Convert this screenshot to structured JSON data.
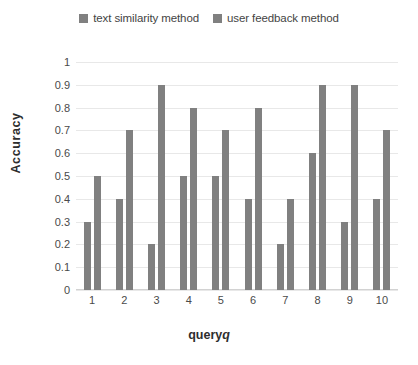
{
  "chart_data": {
    "type": "bar",
    "title": "",
    "xlabel": "query q",
    "xlabel_text": "query",
    "xlabel_variable": "q",
    "ylabel": "Accuracy",
    "categories": [
      "1",
      "2",
      "3",
      "4",
      "5",
      "6",
      "7",
      "8",
      "9",
      "10"
    ],
    "series": [
      {
        "name": "text similarity method",
        "color": "#808080",
        "values": [
          0.3,
          0.4,
          0.2,
          0.5,
          0.5,
          0.4,
          0.2,
          0.6,
          0.3,
          0.4
        ]
      },
      {
        "name": "user feedback method",
        "color": "#808080",
        "values": [
          0.5,
          0.7,
          0.9,
          0.8,
          0.7,
          0.8,
          0.4,
          0.9,
          0.9,
          0.7
        ]
      }
    ],
    "ylim": [
      0,
      1
    ],
    "ytick_step": 0.1,
    "ytick_labels": [
      "1",
      "0.9",
      "0.8",
      "0.7",
      "0.6",
      "0.5",
      "0.4",
      "0.3",
      "0.2",
      "0.1",
      "0"
    ],
    "ytick_values": [
      1,
      0.9,
      0.8,
      0.7,
      0.6,
      0.5,
      0.4,
      0.3,
      0.2,
      0.1,
      0
    ],
    "grid": true,
    "grid_axis": "y",
    "grid_color": "#e8e8e8",
    "legend_position": "top-center",
    "background": "#ffffff"
  },
  "legend": {
    "entries": [
      {
        "label": "text similarity method",
        "color": "#808080"
      },
      {
        "label": "user feedback method",
        "color": "#808080"
      }
    ]
  }
}
